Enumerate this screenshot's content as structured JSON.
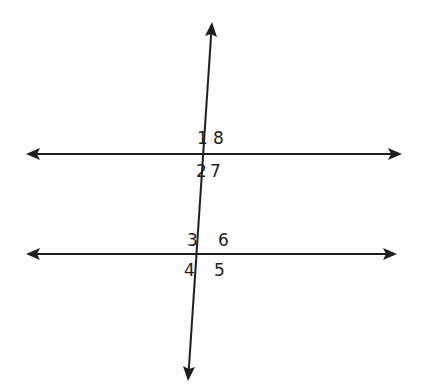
{
  "diagram": {
    "colors": {
      "stroke": "#1e1e1e",
      "background": "#fdfdfd"
    },
    "lines": {
      "parallel_top": {
        "y": 154,
        "x1": 26,
        "x2": 402
      },
      "parallel_bottom": {
        "y": 254,
        "x1": 26,
        "x2": 397
      },
      "transversal": {
        "x1": 212,
        "y1": 22,
        "x2": 188,
        "y2": 381
      }
    },
    "angles": [
      {
        "label": "1",
        "position": "top intersection, upper-left"
      },
      {
        "label": "8",
        "position": "top intersection, upper-right"
      },
      {
        "label": "2",
        "position": "top intersection, lower-left"
      },
      {
        "label": "7",
        "position": "top intersection, lower-right"
      },
      {
        "label": "3",
        "position": "bottom intersection, upper-left"
      },
      {
        "label": "6",
        "position": "bottom intersection, upper-right"
      },
      {
        "label": "4",
        "position": "bottom intersection, lower-left"
      },
      {
        "label": "5",
        "position": "bottom intersection, lower-right"
      }
    ]
  }
}
